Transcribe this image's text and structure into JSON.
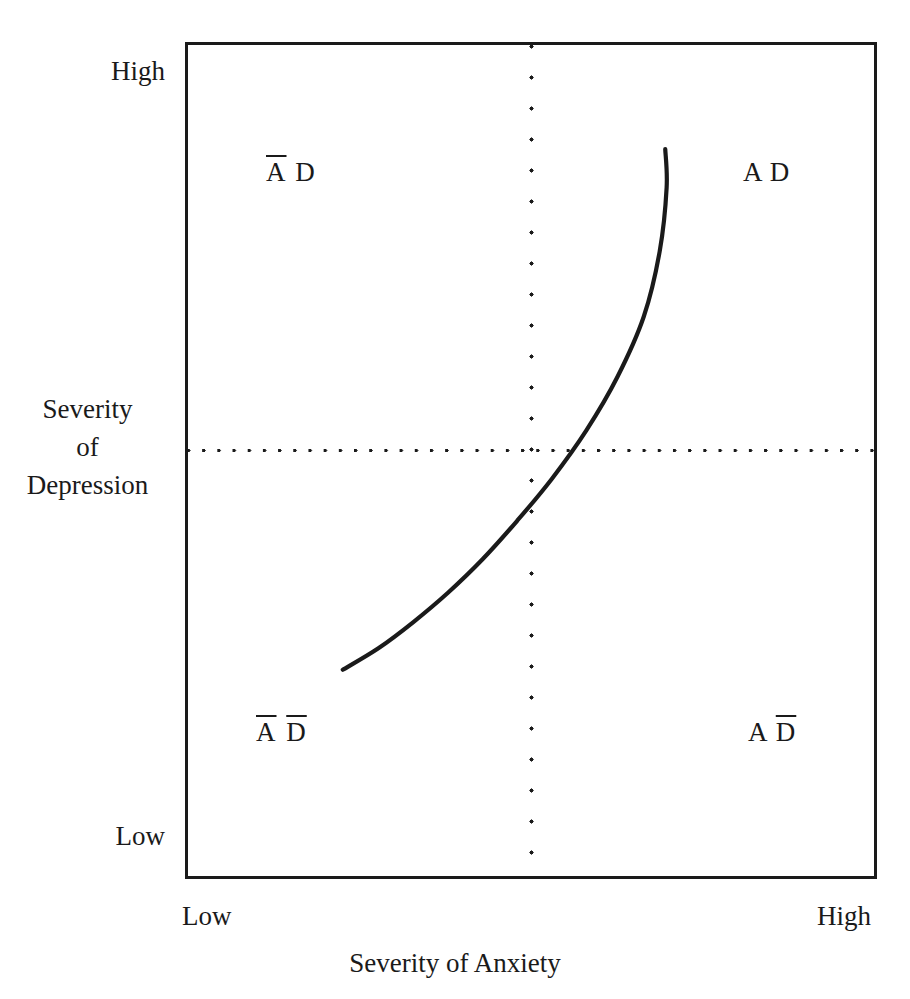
{
  "chart_data": {
    "type": "line",
    "title": "",
    "subtitle": "",
    "xlabel": "Severity of Anxiety",
    "ylabel": "Severity of Depression",
    "xlim": [
      0,
      1
    ],
    "ylim": [
      0,
      1
    ],
    "grid": false,
    "legend": null,
    "x_tick_labels": [
      "Low",
      "High"
    ],
    "y_tick_labels": [
      "Low",
      "High"
    ],
    "reference_lines": [
      {
        "orientation": "vertical",
        "x": 0.5,
        "style": "dotted",
        "label": ""
      },
      {
        "orientation": "horizontal",
        "y": 0.512,
        "style": "dotted",
        "label": ""
      }
    ],
    "series": [
      {
        "name": "anxiety-depression relationship",
        "style": "solid",
        "color": "#1a1a1a",
        "x": [
          0.228,
          0.28,
          0.33,
          0.38,
          0.43,
          0.48,
          0.53,
          0.58,
          0.625,
          0.663,
          0.686,
          0.696,
          0.694
        ],
        "y": [
          0.25,
          0.276,
          0.307,
          0.342,
          0.382,
          0.428,
          0.478,
          0.536,
          0.6,
          0.672,
          0.75,
          0.826,
          0.872
        ]
      }
    ],
    "annotations": [
      {
        "name": "quadrant-top-left",
        "text": "A D",
        "a_overbar": true,
        "d_overbar": false,
        "x": 0.117,
        "y": 0.842
      },
      {
        "name": "quadrant-top-right",
        "text": "A D",
        "a_overbar": false,
        "d_overbar": false,
        "x": 0.809,
        "y": 0.842
      },
      {
        "name": "quadrant-bottom-left",
        "text": "A D",
        "a_overbar": true,
        "d_overbar": true,
        "x": 0.103,
        "y": 0.172
      },
      {
        "name": "quadrant-bottom-right",
        "text": "A D",
        "a_overbar": false,
        "d_overbar": true,
        "x": 0.816,
        "y": 0.172
      }
    ]
  },
  "axes": {
    "y": {
      "title_lines": [
        "Severity",
        "of",
        "Depression"
      ],
      "high_label": "High",
      "low_label": "Low"
    },
    "x": {
      "title": "Severity of Anxiety",
      "low_label": "Low",
      "high_label": "High"
    }
  },
  "quadrants": {
    "top_left": {
      "a": "A",
      "d": "D"
    },
    "top_right": {
      "a": "A",
      "d": "D"
    },
    "bottom_left": {
      "a": "A",
      "d": "D"
    },
    "bottom_right": {
      "a": "A",
      "d": "D"
    }
  },
  "colors": {
    "ink": "#1a1a1a",
    "background": "#ffffff",
    "curve": "#1a1a1a"
  }
}
